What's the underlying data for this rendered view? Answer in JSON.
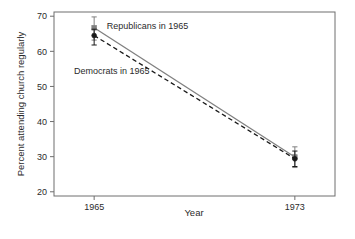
{
  "chart_data": {
    "type": "line",
    "title": "",
    "subtitle": "",
    "xlabel": "Year",
    "ylabel": "Percent attending church regularly",
    "x": [
      1965,
      1973
    ],
    "xtick_labels": [
      "1965",
      "1973"
    ],
    "ytick_labels": [
      "20",
      "30",
      "40",
      "50",
      "60",
      "70"
    ],
    "ytick_values": [
      20,
      30,
      40,
      50,
      60,
      70
    ],
    "xlim": [
      1963.4,
      1974.6
    ],
    "ylim": [
      18.8,
      71.2
    ],
    "grid": false,
    "legend": "inline-annotations",
    "series": [
      {
        "name": "Republicans in 1965",
        "style": "solid",
        "color": "#808080",
        "marker": "square",
        "values": [
          66.7,
          29.9
        ],
        "error_low": [
          63.2,
          26.9
        ],
        "error_high": [
          69.8,
          32.8
        ]
      },
      {
        "name": "Democrats in 1965",
        "style": "dashed",
        "color": "#1a1a1a",
        "marker": "circle",
        "values": [
          64.5,
          29.4
        ],
        "error_low": [
          61.8,
          27.2
        ],
        "error_high": [
          66.3,
          31.6
        ]
      }
    ],
    "annotations": [
      {
        "text": "Republicans in 1965",
        "x": 1965.5,
        "y": 66.4
      },
      {
        "text": "Democrats in 1965",
        "x": 1964.2,
        "y": 53.5
      }
    ]
  },
  "colors": {
    "frame": "#6e6e6e",
    "republican_line": "#808080",
    "democrat_line": "#1a1a1a",
    "text": "#2b2b2b",
    "background": "#ffffff"
  }
}
